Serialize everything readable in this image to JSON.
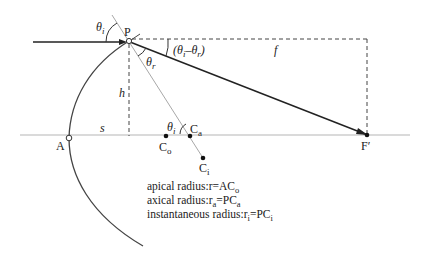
{
  "diagram": {
    "points": {
      "P": "P",
      "A": "A",
      "F_prime": "F′",
      "C_o": {
        "base": "C",
        "sub": "o"
      },
      "C_a": {
        "base": "C",
        "sub": "a"
      },
      "C_i": {
        "base": "C",
        "sub": "i"
      }
    },
    "angles": {
      "theta_i_top": {
        "base": "θ",
        "sub": "i"
      },
      "theta_r": {
        "base": "θ",
        "sub": "r"
      },
      "theta_i_bottom": {
        "base": "θ",
        "sub": "i"
      },
      "deviation": {
        "open": "(",
        "a": "θ",
        "a_sub": "i",
        "minus": "–",
        "b": "θ",
        "b_sub": "r",
        "close": ")"
      }
    },
    "lengths": {
      "h": "h",
      "s": "s",
      "f": "f"
    },
    "legend": [
      {
        "prefix": "apical radius:r=AC",
        "sub": "o"
      },
      {
        "prefix": "axical radius:r",
        "sub1": "a",
        "mid": "=PC",
        "sub": "a"
      },
      {
        "prefix": "instantaneous radius:r",
        "sub1": "i",
        "mid": "=PC",
        "sub": "i"
      }
    ],
    "colors": {
      "ray": "#222222",
      "axis": "#b5b5b5",
      "normal": "#a8a8a8",
      "dashed": "#444444",
      "curve": "#444444"
    }
  }
}
